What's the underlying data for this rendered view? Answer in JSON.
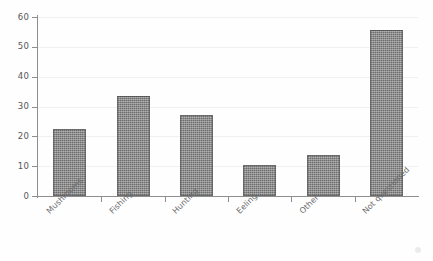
{
  "chart_data": {
    "type": "bar",
    "title": "",
    "subtitle": "",
    "xlabel": "",
    "ylabel": "",
    "categories": [
      "Mushrooms",
      "Fishing",
      "Hunting",
      "Eeling",
      "Other",
      "Not questioned"
    ],
    "values": [
      22.3,
      33.4,
      27.0,
      10.3,
      13.6,
      55.8
    ],
    "ylim": [
      0,
      60
    ],
    "yticks": [
      0,
      10,
      20,
      30,
      40,
      50,
      60
    ],
    "ytick_labels": [
      "0",
      "10",
      "20",
      "30",
      "40",
      "50",
      "60"
    ],
    "grid": true,
    "grid_axis": "y",
    "legend": false,
    "legend_position": "none",
    "bar_color": "#6d6d6d",
    "axis_color": "#8e8e8e",
    "grid_color": "#f0f0f0",
    "label_color": "#6b6b6b",
    "label_rotation_deg": -45,
    "background_color": "#fefefe"
  }
}
